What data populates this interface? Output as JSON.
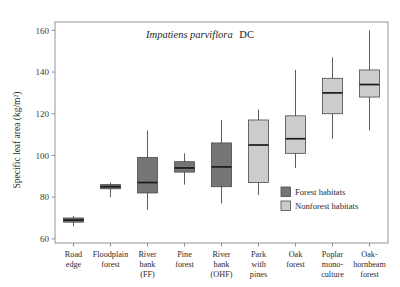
{
  "chart_data": {
    "type": "box",
    "title": "Impatiens parviflora DC",
    "title_italic_part": "Impatiens parviflora",
    "title_roman_part": "DC",
    "xlabel": "",
    "ylabel": "Specific leaf area (kg/m²)",
    "ylim": [
      58,
      164
    ],
    "yticks": [
      60,
      80,
      100,
      120,
      140,
      160
    ],
    "ytick_labels": [
      "60",
      "80",
      "100",
      "120",
      "140",
      "160"
    ],
    "grid": false,
    "legend_position": "inside-lower-right",
    "categories": [
      "Road edge",
      "Floodplain forest",
      "River bank (FF)",
      "Pine forest",
      "River bank (OHF)",
      "Park with pines",
      "Oak forest",
      "Poplar mono-culture",
      "Oak-hornbeam forest"
    ],
    "category_lines": [
      [
        "Road",
        "edge"
      ],
      [
        "Floodplain",
        "forest"
      ],
      [
        "River",
        "bank",
        "(FF)"
      ],
      [
        "Pine",
        "forest"
      ],
      [
        "River",
        "bank",
        "(OHF)"
      ],
      [
        "Park",
        "with",
        "pines"
      ],
      [
        "Oak",
        "forest"
      ],
      [
        "Poplar",
        "mono-",
        "culture"
      ],
      [
        "Oak-",
        "hornbeam",
        "forest"
      ]
    ],
    "boxes": [
      {
        "category": "Road edge",
        "group": "Forest habitats",
        "whisker_low": 66,
        "q1": 68,
        "median": 69,
        "q3": 70,
        "whisker_high": 71
      },
      {
        "category": "Floodplain forest",
        "group": "Forest habitats",
        "whisker_low": 80,
        "q1": 84,
        "median": 85,
        "q3": 86,
        "whisker_high": 87
      },
      {
        "category": "River bank (FF)",
        "group": "Forest habitats",
        "whisker_low": 74,
        "q1": 82,
        "median": 87,
        "q3": 99,
        "whisker_high": 112
      },
      {
        "category": "Pine forest",
        "group": "Forest habitats",
        "whisker_low": 86,
        "q1": 92,
        "median": 94,
        "q3": 97,
        "whisker_high": 101
      },
      {
        "category": "River bank (OHF)",
        "group": "Forest habitats",
        "whisker_low": 77,
        "q1": 85,
        "median": 94.5,
        "q3": 106,
        "whisker_high": 117
      },
      {
        "category": "Park with pines",
        "group": "Nonforest habitats",
        "whisker_low": 81,
        "q1": 87,
        "median": 105,
        "q3": 117,
        "whisker_high": 122
      },
      {
        "category": "Oak forest",
        "group": "Nonforest habitats",
        "whisker_low": 94,
        "q1": 101,
        "median": 108,
        "q3": 119,
        "whisker_high": 141
      },
      {
        "category": "Poplar mono-culture",
        "group": "Nonforest habitats",
        "whisker_low": 108,
        "q1": 120,
        "median": 130,
        "q3": 137,
        "whisker_high": 147
      },
      {
        "category": "Oak-hornbeam forest",
        "group": "Nonforest habitats",
        "whisker_low": 112,
        "q1": 128,
        "median": 134,
        "q3": 141,
        "whisker_high": 160
      }
    ],
    "legend": [
      {
        "label": "Forest habitats",
        "color": "#767676"
      },
      {
        "label": "Nonforest habitats",
        "color": "#cccccc"
      }
    ],
    "colors": {
      "forest": "#767676",
      "nonforest": "#cccccc",
      "frame": "#8a8a8a",
      "median": "#1a1a1a",
      "text": "#2b2b2b",
      "background": "#ffffff"
    }
  }
}
